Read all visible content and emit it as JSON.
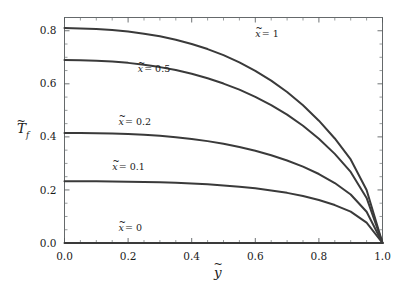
{
  "chart_data": {
    "type": "line",
    "title": "",
    "subtitle": "",
    "xlabel": "ỹ",
    "ylabel": "T̃_f",
    "xlim": [
      0.0,
      1.0
    ],
    "ylim": [
      0.0,
      0.85
    ],
    "grid": false,
    "legend_position": "inline-annotations",
    "x_ticks": [
      0.0,
      0.2,
      0.4,
      0.6,
      0.8,
      1.0
    ],
    "x_tick_labels": [
      "0.0",
      "0.2",
      "0.4",
      "0.6",
      "0.8",
      "1.0"
    ],
    "y_ticks": [
      0.0,
      0.2,
      0.4,
      0.6,
      0.8
    ],
    "y_tick_labels": [
      "0.0",
      "0.2",
      "0.4",
      "0.6",
      "0.8"
    ],
    "x_minor_step": 0.05,
    "y_minor_step": 0.05,
    "x": [
      0.0,
      0.05,
      0.1,
      0.15,
      0.2,
      0.25,
      0.3,
      0.35,
      0.4,
      0.45,
      0.5,
      0.55,
      0.6,
      0.65,
      0.7,
      0.75,
      0.8,
      0.85,
      0.9,
      0.95,
      1.0
    ],
    "series": [
      {
        "name": "x̃ = 1",
        "label": "x̃ = 1",
        "y0": 0.81,
        "values": [
          0.81,
          0.809,
          0.807,
          0.803,
          0.797,
          0.789,
          0.779,
          0.766,
          0.75,
          0.731,
          0.708,
          0.681,
          0.649,
          0.612,
          0.569,
          0.519,
          0.461,
          0.394,
          0.315,
          0.2,
          0.0
        ]
      },
      {
        "name": "x̃ = 0.5",
        "label": "x̃ = 0.5",
        "y0": 0.69,
        "values": [
          0.69,
          0.689,
          0.687,
          0.684,
          0.679,
          0.672,
          0.663,
          0.652,
          0.638,
          0.621,
          0.601,
          0.578,
          0.551,
          0.52,
          0.484,
          0.442,
          0.393,
          0.336,
          0.268,
          0.17,
          0.0
        ]
      },
      {
        "name": "x̃ = 0.2",
        "label": "x̃ = 0.2",
        "y0": 0.415,
        "values": [
          0.415,
          0.415,
          0.414,
          0.413,
          0.411,
          0.408,
          0.404,
          0.399,
          0.392,
          0.384,
          0.374,
          0.362,
          0.348,
          0.331,
          0.311,
          0.288,
          0.26,
          0.226,
          0.183,
          0.118,
          0.0
        ]
      },
      {
        "name": "x̃ = 0.1",
        "label": "x̃ = 0.1",
        "y0": 0.233,
        "values": [
          0.233,
          0.233,
          0.233,
          0.232,
          0.231,
          0.23,
          0.229,
          0.227,
          0.224,
          0.221,
          0.217,
          0.212,
          0.206,
          0.198,
          0.189,
          0.177,
          0.162,
          0.143,
          0.118,
          0.077,
          0.0
        ]
      },
      {
        "name": "x̃ = 0",
        "label": "x̃ = 0",
        "y0": 0.0,
        "values": [
          0.0,
          0.0,
          0.0,
          0.0,
          0.0,
          0.0,
          0.0,
          0.0,
          0.0,
          0.0,
          0.0,
          0.0,
          0.0,
          0.0,
          0.0,
          0.0,
          0.0,
          0.0,
          0.0,
          0.0,
          0.0
        ]
      }
    ],
    "annotations": [
      {
        "text": "x̃ = 1",
        "x": 0.6,
        "y": 0.775
      },
      {
        "text": "x̃ = 0.5",
        "x": 0.23,
        "y": 0.645
      },
      {
        "text": "x̃ = 0.2",
        "x": 0.17,
        "y": 0.445
      },
      {
        "text": "x̃ = 0.1",
        "x": 0.15,
        "y": 0.275
      },
      {
        "text": "x̃ = 0",
        "x": 0.17,
        "y": 0.045
      }
    ],
    "colors": {
      "curve": "#3a3a3a",
      "frame": "#555a5c",
      "text": "#1a1a1a",
      "background": "#ffffff"
    }
  },
  "axes": {
    "ylabel_main": "T",
    "ylabel_sub": "f",
    "xlabel_main": "y"
  },
  "tick_labels": {
    "x": [
      "0.0",
      "0.2",
      "0.4",
      "0.6",
      "0.8",
      "1.0"
    ],
    "y": [
      "0.0",
      "0.2",
      "0.4",
      "0.6",
      "0.8"
    ]
  }
}
